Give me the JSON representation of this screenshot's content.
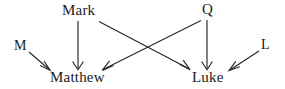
{
  "diagram": {
    "type": "directed-graph",
    "title": "",
    "background_color": "#ffffff",
    "stroke_color": "#262626",
    "text_color": "#1a1a1a",
    "nodes": [
      {
        "id": "mark",
        "label": "Mark",
        "x": 80,
        "y": 11,
        "role": "source"
      },
      {
        "id": "q",
        "label": "Q",
        "x": 207,
        "y": 10,
        "role": "source"
      },
      {
        "id": "m",
        "label": "M",
        "x": 21,
        "y": 46,
        "role": "source"
      },
      {
        "id": "l",
        "label": "L",
        "x": 266,
        "y": 45,
        "role": "source"
      },
      {
        "id": "matthew",
        "label": "Matthew",
        "x": 81,
        "y": 78,
        "role": "target"
      },
      {
        "id": "luke",
        "label": "Luke",
        "x": 208,
        "y": 78,
        "role": "target"
      }
    ],
    "edges": [
      {
        "id": "mark-matthew",
        "from": "mark",
        "to": "matthew",
        "arrow": "to"
      },
      {
        "id": "mark-luke",
        "from": "mark",
        "to": "luke",
        "arrow": "to"
      },
      {
        "id": "q-matthew",
        "from": "q",
        "to": "matthew",
        "arrow": "to"
      },
      {
        "id": "q-luke",
        "from": "q",
        "to": "luke",
        "arrow": "to"
      },
      {
        "id": "m-matthew",
        "from": "m",
        "to": "matthew",
        "arrow": "to"
      },
      {
        "id": "l-luke",
        "from": "l",
        "to": "luke",
        "arrow": "to"
      }
    ]
  }
}
